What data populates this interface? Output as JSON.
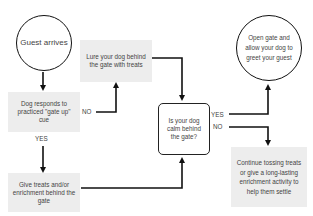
{
  "nodes": {
    "guest_arrives": "Guest arrives",
    "lure": "Lure your dog behind the gate with treats",
    "dog_responds": "Dog responds to practiced \"gate up\" cue",
    "give_treats": "Give treats and/or enrichment behind the gate",
    "is_calm": "Is your dog calm behind the gate?",
    "open_gate": "Open gate and allow your dog to greet your guest",
    "continue": "Continue tossing treats or give a long-lasting enrichment activity to help them settle"
  },
  "edge_labels": {
    "responds_no": "NO",
    "responds_yes": "YES",
    "calm_yes": "YES",
    "calm_no": "NO"
  },
  "colors": {
    "box_fill": "#ededed",
    "line": "#111111",
    "text": "#444444"
  }
}
